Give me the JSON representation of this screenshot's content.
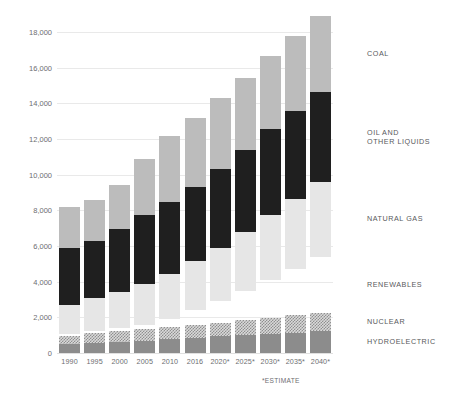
{
  "chart_data": {
    "type": "bar",
    "stacked": true,
    "title": "",
    "subtitle": "",
    "xlabel": "",
    "ylabel": "",
    "ylim": [
      0,
      18000
    ],
    "ytick_step": 2000,
    "grid": true,
    "legend_position": "right",
    "footnote": "*ESTIMATE",
    "categories": [
      "1990",
      "1995",
      "2000",
      "2005",
      "2010",
      "2016",
      "2020*",
      "2025*",
      "2030*",
      "2035*",
      "2040*"
    ],
    "ytick_labels": [
      "0",
      "2,000",
      "4,000",
      "6,000",
      "8,000",
      "10,000",
      "12,000",
      "14,000",
      "16,000",
      "18,000"
    ],
    "ytick_values": [
      0,
      2000,
      4000,
      6000,
      8000,
      10000,
      12000,
      14000,
      16000,
      18000
    ],
    "series": [
      {
        "name": "HYDROELECTRIC",
        "color": "#8c8c8c",
        "values": [
          520,
          560,
          600,
          650,
          760,
          870,
          930,
          1000,
          1070,
          1140,
          1210
        ]
      },
      {
        "name": "NUCLEAR",
        "color": "#d9d9d9",
        "pattern": "checkered",
        "values": [
          460,
          590,
          640,
          670,
          710,
          710,
          780,
          850,
          920,
          980,
          1040
        ]
      },
      {
        "name": "RENEWABLES",
        "color": "#949494",
        "values": [
          80,
          110,
          150,
          230,
          430,
          860,
          1180,
          1620,
          2090,
          2600,
          3160
        ]
      },
      {
        "name": "NATURAL GAS",
        "color": "#e6e6e6",
        "values": [
          1650,
          1820,
          2060,
          2330,
          2550,
          2730,
          3000,
          3300,
          3660,
          3930,
          4190
        ]
      },
      {
        "name": "OIL AND OTHER LIQUIDS",
        "color": "#1f1f1f",
        "values": [
          3200,
          3200,
          3530,
          3860,
          4030,
          4140,
          4420,
          4620,
          4820,
          4940,
          5050
        ]
      },
      {
        "name": "COAL",
        "color": "#bcbcbc",
        "values": [
          2290,
          2320,
          2420,
          3160,
          3710,
          3890,
          3990,
          4060,
          4110,
          4170,
          4230
        ]
      }
    ],
    "totals": [
      8200,
      8600,
      9400,
      10900,
      12190,
      13200,
      14300,
      15450,
      16670,
      17760,
      18880
    ]
  },
  "legend": {
    "items": [
      {
        "label": "COAL",
        "key": "coal"
      },
      {
        "label": "OIL AND\nOTHER LIQUIDS",
        "key": "oil"
      },
      {
        "label": "NATURAL GAS",
        "key": "gas"
      },
      {
        "label": "RENEWABLES",
        "key": "renewables"
      },
      {
        "label": "NUCLEAR",
        "key": "nuclear"
      },
      {
        "label": "HYDROELECTRIC",
        "key": "hydro"
      }
    ]
  },
  "colors": {
    "coal": "#bcbcbc",
    "oil": "#1f1f1f",
    "gas": "#e6e6e6",
    "renewables": "#949494",
    "nuclear": "#d9d9d9",
    "hydro": "#8c8c8c",
    "grid": "#e9e9e9",
    "text": "#6d6e71",
    "background": "#ffffff"
  }
}
